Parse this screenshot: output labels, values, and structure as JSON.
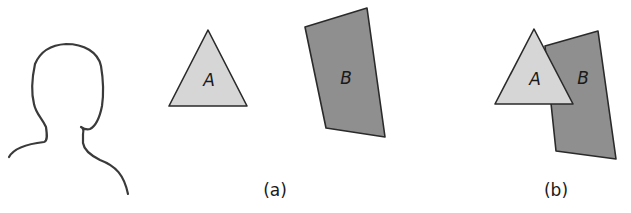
{
  "figure": {
    "observer": {
      "label": ""
    },
    "panel_a": {
      "caption": "(a)",
      "shape_a": {
        "label": "A",
        "fill": "#d6d6d6",
        "stroke": "#2a2a2a"
      },
      "shape_b": {
        "label": "B",
        "fill": "#8f8f8f",
        "stroke": "#2a2a2a"
      }
    },
    "panel_b": {
      "caption": "(b)",
      "shape_a": {
        "label": "A",
        "fill": "#d6d6d6",
        "stroke": "#2a2a2a"
      },
      "shape_b": {
        "label": "B",
        "fill": "#8f8f8f",
        "stroke": "#2a2a2a"
      }
    }
  }
}
